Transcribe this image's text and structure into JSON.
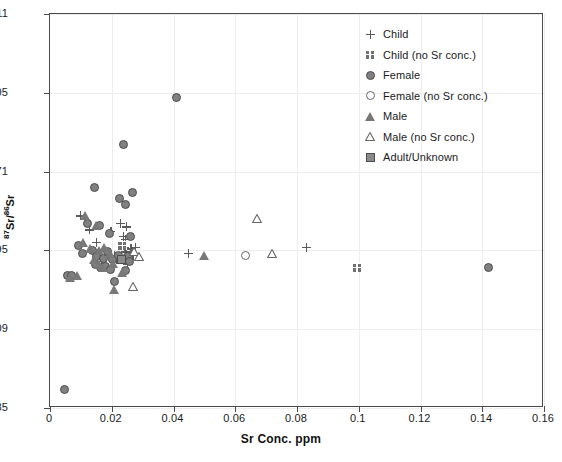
{
  "chart_data": {
    "type": "scatter",
    "title": "",
    "xlabel": "Sr Conc. ppm",
    "ylabel": "87Sr/86Sr",
    "ylabel_display": "Sr/ Sr",
    "ylabel_sup_num": "87",
    "ylabel_sup_den": "86",
    "xlim": [
      0,
      0.16
    ],
    "ylim": [
      0.7085,
      0.711
    ],
    "ylim_top_label": "0.711",
    "xticks": [
      0,
      0.02,
      0.04,
      0.06,
      0.08,
      0.1,
      0.12,
      0.14,
      0.16
    ],
    "xticklabels": [
      "0",
      "0.02",
      "0.04",
      "0.06",
      "0.08",
      "0.1",
      "0.12",
      "0.14",
      "0.16"
    ],
    "yticks": [
      0.7085,
      0.709,
      0.7095,
      0.71,
      0.7105,
      0.711
    ],
    "yticklabels": [
      "0.7085",
      "0.709",
      "0.7095",
      "0.71",
      "0.7105",
      "0.711"
    ],
    "grid": true,
    "grid_color": "#ededed",
    "legend_position": "top-right",
    "frame_color": "#4a4a4a",
    "series": [
      {
        "name": "Child",
        "marker": "plus",
        "color": "#5a5a5a",
        "points": [
          [
            0.0098,
            0.70972
          ],
          [
            0.0128,
            0.70963
          ],
          [
            0.015,
            0.70955
          ],
          [
            0.0197,
            0.70962
          ],
          [
            0.0228,
            0.70967
          ],
          [
            0.0248,
            0.70965
          ],
          [
            0.0238,
            0.70959
          ],
          [
            0.0244,
            0.70957
          ],
          [
            0.0241,
            0.70952
          ],
          [
            0.0245,
            0.70949
          ],
          [
            0.0262,
            0.70951
          ],
          [
            0.0277,
            0.70952
          ],
          [
            0.0268,
            0.70947
          ],
          [
            0.0208,
            0.70947
          ],
          [
            0.0216,
            0.70944
          ],
          [
            0.0168,
            0.70943
          ],
          [
            0.025,
            0.70941
          ],
          [
            0.0448,
            0.70948
          ],
          [
            0.083,
            0.70952
          ]
        ]
      },
      {
        "name": "Child (no Sr conc.)",
        "marker": "checkered-square",
        "color": "#707070",
        "points": [
          [
            0.0235,
            0.70953
          ],
          [
            0.0995,
            0.70939
          ]
        ]
      },
      {
        "name": "Female",
        "marker": "filled-circle",
        "color": "#808080",
        "points": [
          [
            0.041,
            0.71047
          ],
          [
            0.0238,
            0.71017
          ],
          [
            0.0143,
            0.7099
          ],
          [
            0.0225,
            0.70983
          ],
          [
            0.0268,
            0.70987
          ],
          [
            0.0246,
            0.70979
          ],
          [
            0.0123,
            0.70967
          ],
          [
            0.0161,
            0.70966
          ],
          [
            0.0194,
            0.70961
          ],
          [
            0.0262,
            0.70959
          ],
          [
            0.0092,
            0.70953
          ],
          [
            0.0104,
            0.70948
          ],
          [
            0.0137,
            0.7095
          ],
          [
            0.0152,
            0.70946
          ],
          [
            0.0172,
            0.70945
          ],
          [
            0.0186,
            0.70949
          ],
          [
            0.0202,
            0.70944
          ],
          [
            0.0222,
            0.70947
          ],
          [
            0.0238,
            0.70944
          ],
          [
            0.025,
            0.70946
          ],
          [
            0.0259,
            0.70943
          ],
          [
            0.0147,
            0.70941
          ],
          [
            0.0163,
            0.70939
          ],
          [
            0.018,
            0.7094
          ],
          [
            0.0196,
            0.70938
          ],
          [
            0.0243,
            0.70937
          ],
          [
            0.0057,
            0.70934
          ],
          [
            0.0071,
            0.70934
          ],
          [
            0.0208,
            0.7093
          ],
          [
            0.142,
            0.70939
          ],
          [
            0.0048,
            0.70862
          ]
        ]
      },
      {
        "name": "Female (no Sr conc.)",
        "marker": "open-circle",
        "color": "#666666",
        "points": [
          [
            0.0632,
            0.70947
          ]
        ]
      },
      {
        "name": "Male",
        "marker": "filled-triangle",
        "color": "#787878",
        "points": [
          [
            0.0113,
            0.70972
          ],
          [
            0.0148,
            0.70966
          ],
          [
            0.0106,
            0.70955
          ],
          [
            0.0129,
            0.70951
          ],
          [
            0.016,
            0.7095
          ],
          [
            0.0176,
            0.70952
          ],
          [
            0.0193,
            0.70948
          ],
          [
            0.0144,
            0.70944
          ],
          [
            0.0159,
            0.70941
          ],
          [
            0.0172,
            0.70939
          ],
          [
            0.0205,
            0.70942
          ],
          [
            0.0065,
            0.70933
          ],
          [
            0.0088,
            0.70934
          ],
          [
            0.0206,
            0.70925
          ],
          [
            0.0234,
            0.70936
          ],
          [
            0.05,
            0.70947
          ]
        ]
      },
      {
        "name": "Male (no Sr conc.)",
        "marker": "open-triangle",
        "color": "#666666",
        "points": [
          [
            0.0272,
            0.70949
          ],
          [
            0.0289,
            0.70946
          ],
          [
            0.027,
            0.70927
          ],
          [
            0.067,
            0.7097
          ],
          [
            0.0718,
            0.70948
          ]
        ]
      },
      {
        "name": "Adult/Unknown",
        "marker": "filled-square",
        "color": "#8a8a8a",
        "points": [
          [
            0.0232,
            0.70944
          ]
        ]
      }
    ]
  },
  "axes": {
    "x_title": "Sr Conc. ppm",
    "y_title_base": "Sr/",
    "y_title_base2": "Sr",
    "y_sup_1": "87",
    "y_sup_2": "86"
  },
  "legend": {
    "items": [
      {
        "label": "Child",
        "marker": "plus-icon"
      },
      {
        "label": "Child (no Sr conc.)",
        "marker": "checkered-square-icon"
      },
      {
        "label": "Female",
        "marker": "filled-circle-icon"
      },
      {
        "label": "Female (no Sr conc.)",
        "marker": "open-circle-icon"
      },
      {
        "label": "Male",
        "marker": "filled-triangle-icon"
      },
      {
        "label": "Male (no Sr conc.)",
        "marker": "open-triangle-icon"
      },
      {
        "label": "Adult/Unknown",
        "marker": "filled-square-icon"
      }
    ]
  }
}
